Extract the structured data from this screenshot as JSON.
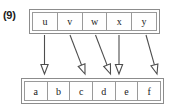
{
  "figure": {
    "label": "(9)",
    "caption_visible": false
  },
  "diagram": {
    "type": "mapping-diagram",
    "domain_set": {
      "name": "top-set",
      "cells": [
        {
          "id": "u",
          "label": "u"
        },
        {
          "id": "v",
          "label": "v"
        },
        {
          "id": "w",
          "label": "w"
        },
        {
          "id": "x",
          "label": "x"
        },
        {
          "id": "y",
          "label": "y"
        }
      ]
    },
    "codomain_set": {
      "name": "bottom-set",
      "cells": [
        {
          "id": "a",
          "label": "a"
        },
        {
          "id": "b",
          "label": "b"
        },
        {
          "id": "c",
          "label": "c"
        },
        {
          "id": "d",
          "label": "d"
        },
        {
          "id": "e",
          "label": "e"
        },
        {
          "id": "f",
          "label": "f"
        }
      ]
    },
    "arrows": [
      {
        "from": "u",
        "to": "a",
        "x1": 44.5,
        "y1": 35,
        "x2": 44.5,
        "y2": 74
      },
      {
        "from": "v",
        "to": "c",
        "x1": 70.0,
        "y1": 35,
        "x2": 85.0,
        "y2": 74
      },
      {
        "from": "w",
        "to": "d",
        "x1": 95.5,
        "y1": 35,
        "x2": 110.5,
        "y2": 74
      },
      {
        "from": "x",
        "to": "d",
        "x1": 119.0,
        "y1": 35,
        "x2": 119.0,
        "y2": 74
      },
      {
        "from": "y",
        "to": "f",
        "x1": 146.0,
        "y1": 35,
        "x2": 157.0,
        "y2": 74
      }
    ],
    "colors": {
      "stroke": "#4d4d4d",
      "border": "#8c8c8c",
      "cell_border": "#9a9a9a",
      "text": "#1a1a1a",
      "background": "#ffffff"
    }
  }
}
